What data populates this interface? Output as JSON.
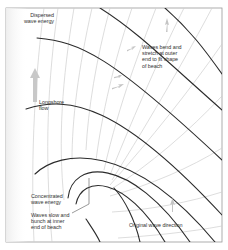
{
  "diagram": {
    "colors": {
      "frame": "#9a9a9a",
      "crest": "#2b2b2b",
      "orthogonal": "#cfcfcf",
      "arrow": "#c8c8c8",
      "text": "#333333",
      "background": "#ffffff"
    },
    "labels": {
      "dispersed": "Dispersed\nwave energy",
      "bend": "Waves bend and\nstretch at outer\nend to fit shape\nof beach",
      "longshore": "Longshore\nflow",
      "concentrated": "Concentrated\nwave energy",
      "slow": "Waves slow and\nbunch at inner\nend of beach",
      "original": "Original wave direction"
    },
    "elements": {
      "wave_crests": "wave-crest-lines",
      "orthogonals": "wave-orthogonal-lines",
      "longshore_arrow": "longshore-flow-arrow",
      "direction_arrows": "wave-direction-arrows"
    }
  }
}
